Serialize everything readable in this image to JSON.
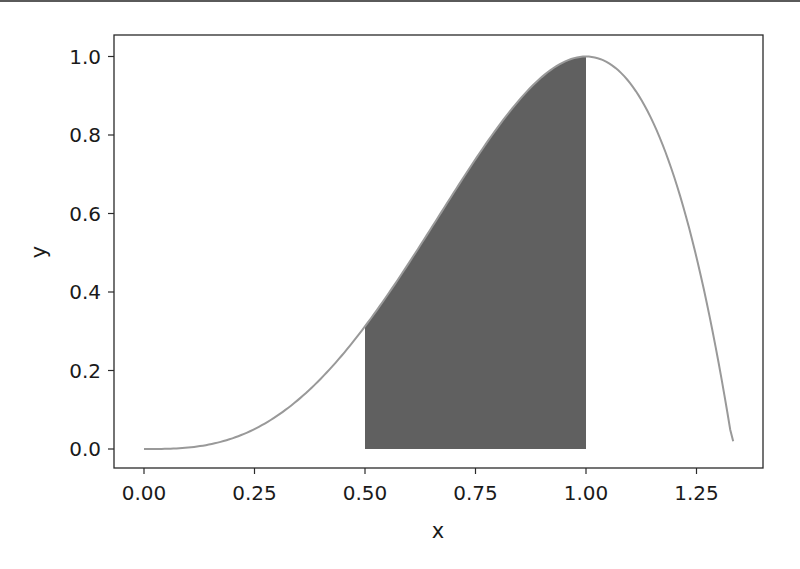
{
  "chart_data": {
    "type": "area",
    "title": "",
    "xlabel": "x",
    "ylabel": "y",
    "function": "y = 4x^3 - 3x^4",
    "xlim": [
      -0.0667,
      1.4
    ],
    "ylim": [
      -0.05,
      1.05
    ],
    "x_ticks": [
      0.0,
      0.25,
      0.5,
      0.75,
      1.0,
      1.25
    ],
    "x_tick_labels": [
      "0.00",
      "0.25",
      "0.50",
      "0.75",
      "1.00",
      "1.25"
    ],
    "y_ticks": [
      0.0,
      0.2,
      0.4,
      0.6,
      0.8,
      1.0
    ],
    "y_tick_labels": [
      "0.0",
      "0.2",
      "0.4",
      "0.6",
      "0.8",
      "1.0"
    ],
    "grid": false,
    "legend": null,
    "series": [
      {
        "name": "curve",
        "color": "#999999",
        "x": [
          0.0,
          0.1,
          0.2,
          0.25,
          0.3,
          0.4,
          0.5,
          0.6,
          0.7,
          0.75,
          0.8,
          0.9,
          1.0,
          1.1,
          1.2,
          1.25,
          1.3,
          1.333
        ],
        "y": [
          0.0,
          0.0037,
          0.0272,
          0.0508,
          0.0837,
          0.1792,
          0.3125,
          0.4752,
          0.6517,
          0.7383,
          0.8192,
          0.9477,
          1.0,
          0.9317,
          0.6912,
          0.4883,
          0.2197,
          0.02
        ]
      }
    ],
    "shaded_region": {
      "x_from": 0.5,
      "x_to": 1.0,
      "color": "#606060",
      "description": "area under curve between x=0.5 and x=1.0"
    }
  }
}
